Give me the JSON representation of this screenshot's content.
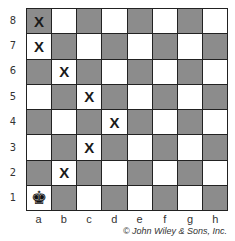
{
  "board": {
    "ranks": [
      "8",
      "7",
      "6",
      "5",
      "4",
      "3",
      "2",
      "1"
    ],
    "files": [
      "a",
      "b",
      "c",
      "d",
      "e",
      "f",
      "g",
      "h"
    ],
    "marker_symbol": "X",
    "king_symbol": "♚",
    "pieces": [
      {
        "square": "a1",
        "type": "king",
        "color": "black"
      }
    ],
    "marked_squares": [
      "a8",
      "a7",
      "b6",
      "c5",
      "d4",
      "c3",
      "b2"
    ],
    "colors": {
      "light": "#ffffff",
      "dark": "#8c8c8c",
      "border": "#222222"
    }
  },
  "credit": "© John Wiley & Sons, Inc."
}
